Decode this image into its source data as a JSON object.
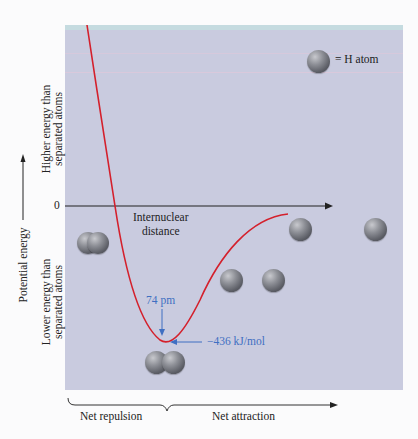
{
  "legend": {
    "symbol": "H-atom-sphere",
    "label": "= H atom"
  },
  "axes": {
    "y_title": "Potential energy",
    "y_upper_region": [
      "Higher energy than",
      "separated atoms"
    ],
    "y_lower_region": [
      "Lower energy than",
      "separated atoms"
    ],
    "zero_label": "0",
    "x_title": [
      "Internuclear",
      "distance"
    ]
  },
  "annotations": {
    "bond_length": "74 pm",
    "bond_energy": "−436 kJ/mol"
  },
  "regions": {
    "repulsion": "Net repulsion",
    "attraction": "Net attraction"
  },
  "colors": {
    "plot_background": "#c9cbdf",
    "curve": "#d4202c",
    "annotation": "#3f6fc2",
    "axis": "#222222"
  }
}
